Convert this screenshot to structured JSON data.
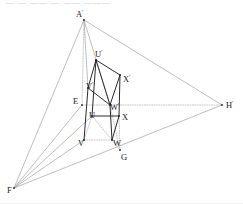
{
  "figure": {
    "type": "geometry-line-drawing",
    "canvas": {
      "width": 243,
      "height": 204
    },
    "background_color": "#ffffff",
    "colors": {
      "solid_line": "#2b2b2b",
      "construction_line": "#9a9a9a",
      "dotted_line": "#b0b0b0",
      "label_text": "#1c1c1c",
      "faint_artifact": "#cfcfcf"
    },
    "top_artifact_text": "— —  ——  —   ——  ———",
    "points": [
      {
        "name": "A-prime",
        "label": "A",
        "prime": true,
        "x": 84,
        "y": 20,
        "label_dx": -8,
        "label_dy": -3
      },
      {
        "name": "U-prime",
        "label": "U",
        "prime": true,
        "x": 96,
        "y": 60,
        "label_dx": -1,
        "label_dy": -3
      },
      {
        "name": "X-prime",
        "label": "X",
        "prime": true,
        "x": 120,
        "y": 75,
        "label_dx": 3,
        "label_dy": 7
      },
      {
        "name": "V-prime",
        "label": "V",
        "prime": true,
        "x": 88,
        "y": 88,
        "label_dx": -2,
        "label_dy": 1
      },
      {
        "name": "E",
        "label": "E",
        "prime": false,
        "x": 82,
        "y": 105,
        "label_dx": -9,
        "label_dy": -1
      },
      {
        "name": "W-prime",
        "label": "W",
        "prime": true,
        "x": 110,
        "y": 105,
        "label_dx": 0,
        "label_dy": 5
      },
      {
        "name": "U",
        "label": "U",
        "prime": false,
        "x": 92,
        "y": 116,
        "label_dx": -3,
        "label_dy": 2
      },
      {
        "name": "X",
        "label": "X",
        "prime": false,
        "x": 119,
        "y": 116,
        "label_dx": 3,
        "label_dy": 4
      },
      {
        "name": "V",
        "label": "V",
        "prime": false,
        "x": 84,
        "y": 140,
        "label_dx": -6,
        "label_dy": 6
      },
      {
        "name": "W",
        "label": "W",
        "prime": false,
        "x": 112,
        "y": 140,
        "label_dx": 1,
        "label_dy": 6
      },
      {
        "name": "G",
        "label": "G",
        "prime": false,
        "x": 120,
        "y": 150,
        "label_dx": 1,
        "label_dy": 10
      },
      {
        "name": "F",
        "label": "F",
        "prime": false,
        "x": 14,
        "y": 188,
        "label_dx": -7,
        "label_dy": 5
      },
      {
        "name": "H-prime",
        "label": "H",
        "prime": true,
        "x": 222,
        "y": 105,
        "label_dx": 4,
        "label_dy": 3
      }
    ],
    "labels": [
      {
        "name": "label-A-prime",
        "text": "A",
        "prime": "'",
        "x": 76,
        "y": 17
      },
      {
        "name": "label-U-prime",
        "text": "U",
        "prime": "'",
        "x": 95,
        "y": 57
      },
      {
        "name": "label-X-prime",
        "text": "X",
        "prime": "'",
        "x": 123,
        "y": 82
      },
      {
        "name": "label-V-prime",
        "text": "V",
        "prime": "'",
        "x": 86,
        "y": 89
      },
      {
        "name": "label-E",
        "text": "E",
        "prime": "",
        "x": 73,
        "y": 104
      },
      {
        "name": "label-W-prime",
        "text": "W",
        "prime": "'",
        "x": 110,
        "y": 110
      },
      {
        "name": "label-U",
        "text": "U",
        "prime": "",
        "x": 89,
        "y": 118
      },
      {
        "name": "label-X",
        "text": "X",
        "prime": "",
        "x": 122,
        "y": 120
      },
      {
        "name": "label-V",
        "text": "V",
        "prime": "",
        "x": 78,
        "y": 146
      },
      {
        "name": "label-W",
        "text": "W",
        "prime": "",
        "x": 113,
        "y": 146
      },
      {
        "name": "label-G",
        "text": "G",
        "prime": "",
        "x": 121,
        "y": 160
      },
      {
        "name": "label-F",
        "text": "F",
        "prime": "",
        "x": 7,
        "y": 193
      },
      {
        "name": "label-H-prime",
        "text": "H",
        "prime": "'",
        "x": 226,
        "y": 108
      }
    ],
    "segments": {
      "construction_triangle": [
        {
          "name": "edge-A-prime-to-F",
          "from": "A-prime",
          "to": "F",
          "style": "construction"
        },
        {
          "name": "edge-A-prime-to-H-prime",
          "from": "A-prime",
          "to": "H-prime",
          "style": "construction"
        },
        {
          "name": "edge-F-to-H-prime",
          "from": "F",
          "to": "H-prime",
          "style": "construction"
        }
      ],
      "vanishing_rays": [
        {
          "name": "ray-A-prime-to-V-prime",
          "from": "A-prime",
          "to": "V-prime",
          "style": "construction"
        },
        {
          "name": "ray-A-prime-to-W-prime",
          "from": "A-prime",
          "to": "W-prime",
          "style": "construction"
        },
        {
          "name": "ray-A-prime-to-E",
          "from": "A-prime",
          "to": "E",
          "style": "dotted"
        },
        {
          "name": "ray-F-to-V",
          "from": "F",
          "to": "V",
          "style": "construction"
        },
        {
          "name": "ray-F-to-U",
          "from": "F",
          "to": "U",
          "style": "construction"
        },
        {
          "name": "ray-F-to-E",
          "from": "F",
          "to": "E",
          "style": "construction"
        },
        {
          "name": "ray-E-to-H-prime",
          "from": "E",
          "to": "H-prime",
          "style": "dotted"
        },
        {
          "name": "ray-W-prime-to-G",
          "from": "W-prime",
          "to": "G",
          "style": "dotted"
        },
        {
          "name": "ray-X-to-G",
          "from": "X",
          "to": "G",
          "style": "dotted"
        },
        {
          "name": "ray-W-to-G",
          "from": "W",
          "to": "G",
          "style": "dotted"
        }
      ],
      "prism_upper_face": [
        {
          "name": "edge-U-prime-to-X-prime",
          "from": "U-prime",
          "to": "X-prime",
          "style": "solid"
        },
        {
          "name": "edge-X-prime-to-W-prime",
          "from": "X-prime",
          "to": "W-prime",
          "style": "solid"
        },
        {
          "name": "edge-W-prime-to-V-prime",
          "from": "W-prime",
          "to": "V-prime",
          "style": "solid"
        },
        {
          "name": "edge-V-prime-to-U-prime",
          "from": "V-prime",
          "to": "U-prime",
          "style": "solid"
        },
        {
          "name": "diagonal-U-prime-to-W-prime",
          "from": "U-prime",
          "to": "W-prime",
          "style": "solid"
        }
      ],
      "prism_verticals": [
        {
          "name": "edge-U-prime-to-U",
          "from": "U-prime",
          "to": "U",
          "style": "solid"
        },
        {
          "name": "edge-X-prime-to-X",
          "from": "X-prime",
          "to": "X",
          "style": "solid"
        },
        {
          "name": "edge-V-prime-to-V",
          "from": "V-prime",
          "to": "V",
          "style": "solid"
        },
        {
          "name": "edge-W-prime-to-W",
          "from": "W-prime",
          "to": "W",
          "style": "solid"
        }
      ],
      "prism_lower_face": [
        {
          "name": "edge-U-to-X",
          "from": "U",
          "to": "X",
          "style": "solid"
        },
        {
          "name": "edge-X-to-W",
          "from": "X",
          "to": "W",
          "style": "solid"
        },
        {
          "name": "edge-W-to-V",
          "from": "W",
          "to": "V",
          "style": "dotted"
        },
        {
          "name": "edge-V-to-U",
          "from": "V",
          "to": "U",
          "style": "dotted"
        },
        {
          "name": "diagonal-U-to-W",
          "from": "U",
          "to": "W",
          "style": "dotted"
        }
      ]
    }
  }
}
